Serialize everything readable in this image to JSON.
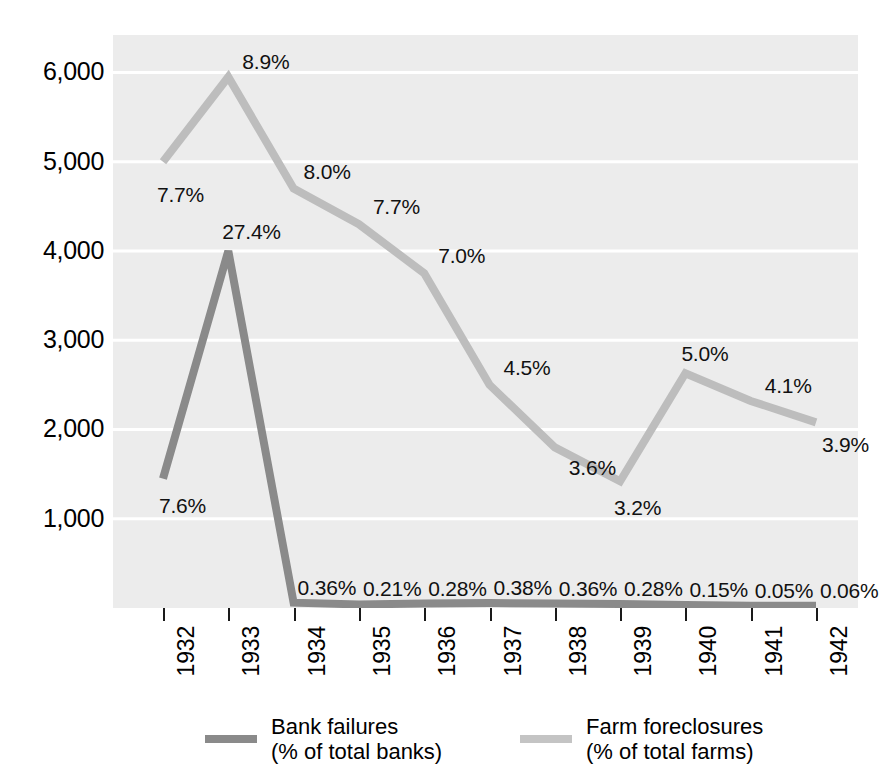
{
  "chart_data": {
    "type": "line",
    "title": "",
    "subtitle": "",
    "xlabel": "",
    "ylabel": "",
    "categories": [
      "1932",
      "1933",
      "1934",
      "1935",
      "1936",
      "1937",
      "1938",
      "1939",
      "1940",
      "1941",
      "1942"
    ],
    "ylim": [
      0,
      6420
    ],
    "yticks": [
      1000,
      2000,
      3000,
      4000,
      5000,
      6000
    ],
    "ytick_labels": [
      "1,000",
      "2,000",
      "3,000",
      "4,000",
      "5,000",
      "6,000"
    ],
    "grid": "horizontal",
    "legend_position": "bottom",
    "series": [
      {
        "name": "Bank failures",
        "unit_label": "(% of total banks)",
        "color": "#8a8a8a",
        "values": [
          1450,
          4000,
          60,
          40,
          50,
          55,
          50,
          45,
          35,
          25,
          25
        ],
        "point_labels": [
          "7.6%",
          "27.4%",
          "0.36%",
          "0.21%",
          "0.28%",
          "0.38%",
          "0.36%",
          "0.28%",
          "0.15%",
          "0.05%",
          "0.06%"
        ]
      },
      {
        "name": "Farm foreclosures",
        "unit_label": "(% of total farms)",
        "color": "#bdbdbd",
        "values": [
          5000,
          5950,
          4700,
          4300,
          3750,
          2500,
          1800,
          1420,
          2630,
          2320,
          2080
        ],
        "point_labels": [
          "7.7%",
          "8.9%",
          "8.0%",
          "7.7%",
          "7.0%",
          "4.5%",
          "3.6%",
          "3.2%",
          "5.0%",
          "4.1%",
          "3.9%"
        ]
      }
    ]
  },
  "legend": {
    "items": [
      {
        "label": "Bank failures\n(% of total banks)",
        "color": "#8a8a8a"
      },
      {
        "label": "Farm foreclosures\n(% of total farms)",
        "color": "#c4c4c4"
      }
    ]
  },
  "colors": {
    "plot_background": "#ececec",
    "gridline": "#ffffff",
    "bank_failures": "#8a8a8a",
    "farm_foreclosures": "#bdbdbd",
    "text": "#000000"
  }
}
